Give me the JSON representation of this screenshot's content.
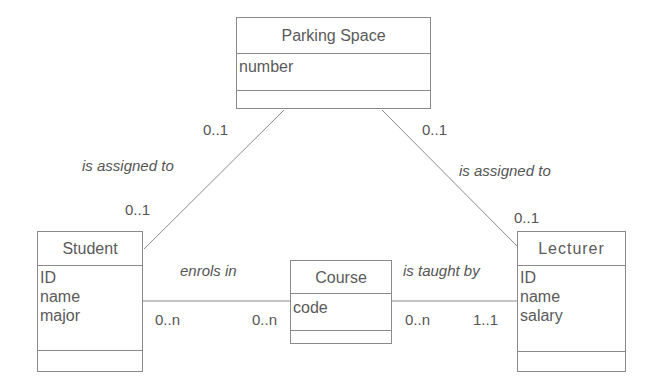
{
  "diagram": {
    "type": "UML class diagram",
    "classes": {
      "parking_space": {
        "name": "Parking Space",
        "attributes": [
          "number"
        ]
      },
      "student": {
        "name": "Student",
        "attributes": [
          "ID",
          "name",
          "major"
        ]
      },
      "course": {
        "name": "Course",
        "attributes": [
          "code"
        ]
      },
      "lecturer": {
        "name": "Lecturer",
        "attributes": [
          "ID",
          "name",
          "salary"
        ]
      }
    },
    "associations": {
      "student_parking": {
        "label": "is assigned to",
        "mult_parking": "0..1",
        "mult_student": "0..1"
      },
      "lecturer_parking": {
        "label": "is assigned to",
        "mult_parking": "0..1",
        "mult_lecturer": "0..1"
      },
      "student_course": {
        "label": "enrols in",
        "mult_student": "0..n",
        "mult_course": "0..n"
      },
      "course_lecturer": {
        "label": "is taught by",
        "mult_course": "0..n",
        "mult_lecturer": "1..1"
      }
    },
    "colors": {
      "line": "#8a8a8a",
      "text": "#555555",
      "background": "#ffffff"
    }
  }
}
